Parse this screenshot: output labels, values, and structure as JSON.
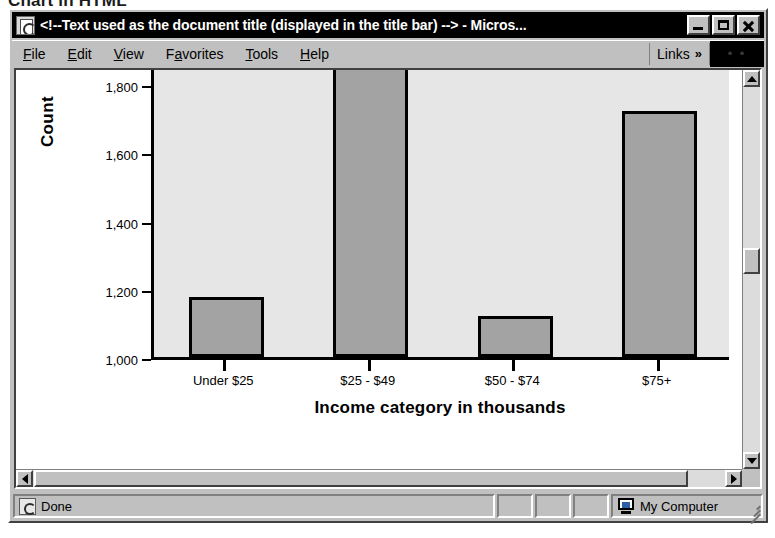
{
  "page_heading": "Chart in HTML",
  "window": {
    "title": "<!--Text used as the document title (displayed in the title bar) --> - Micros...",
    "icon": "ie-document-icon",
    "minimize_label": "Minimize",
    "maximize_label": "Maximize",
    "close_label": "Close"
  },
  "menubar": {
    "items": [
      {
        "label": "File",
        "accel": "F"
      },
      {
        "label": "Edit",
        "accel": "E"
      },
      {
        "label": "View",
        "accel": "V"
      },
      {
        "label": "Favorites",
        "accel": "a"
      },
      {
        "label": "Tools",
        "accel": "T"
      },
      {
        "label": "Help",
        "accel": "H"
      }
    ],
    "links_label": "Links",
    "links_chevron": "»",
    "logo_dots": "• •"
  },
  "scrollbars": {
    "v_up_icon": "arrow-up-icon",
    "v_down_icon": "arrow-down-icon",
    "h_left_icon": "arrow-left-icon",
    "h_right_icon": "arrow-right-icon"
  },
  "statusbar": {
    "status_text": "Done",
    "status_icon": "document-icon",
    "zone_text": "My Computer",
    "zone_icon": "monitor-icon",
    "panes": [
      "",
      "",
      ""
    ],
    "grip_icon": "resize-grip-icon"
  },
  "chart_data": {
    "type": "bar",
    "title": "",
    "categories": [
      "Under $25",
      "$25 - $49",
      "$50 - $74",
      "$75+"
    ],
    "values": [
      1175,
      1900,
      1120,
      1720
    ],
    "xlabel": "Income category in thousands",
    "ylabel": "Count",
    "ylim": [
      1000,
      1850
    ],
    "yticks": [
      1000,
      1200,
      1400,
      1600,
      1800
    ],
    "yticklabels": [
      "1,000",
      "1,200",
      "1,400",
      "1,600",
      "1,800"
    ],
    "grid": false,
    "legend": false,
    "note": "second bar is clipped by the top of the plot area",
    "colors": {
      "bar_fill": "#a3a3a3",
      "bar_border": "#000000",
      "plot_background": "#e6e6e6",
      "axis": "#000000"
    }
  }
}
